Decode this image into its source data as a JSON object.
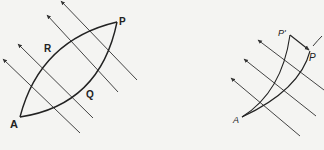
{
  "figure_left": {
    "labels": {
      "A": "A",
      "R": "R",
      "P": "P",
      "Q": "Q"
    },
    "arrow_count": 5,
    "stroke_color": "#333333"
  },
  "figure_right": {
    "labels": {
      "A": "A",
      "P_prime": "P'",
      "P": "P"
    },
    "arrow_count": 3,
    "stroke_color": "#333333"
  },
  "background_color": "#f4f4f2"
}
